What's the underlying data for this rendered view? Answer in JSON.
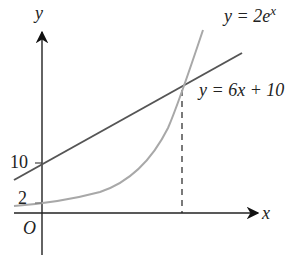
{
  "diagram": {
    "axes": {
      "x_label": "x",
      "y_label": "y",
      "origin_label": "O"
    },
    "tick_labels": {
      "y_10": "10",
      "y_2": "2"
    },
    "curves": [
      {
        "name": "exponential",
        "equation_lhs": "y = 2e",
        "equation_exp": "x",
        "color": "#a8a8a8",
        "y_intercept": 2
      },
      {
        "name": "line",
        "equation": "y = 6x + 10",
        "color": "#555555",
        "y_intercept": 10
      }
    ],
    "intersection_marker": "dashed vertical line from intersection to x-axis"
  }
}
